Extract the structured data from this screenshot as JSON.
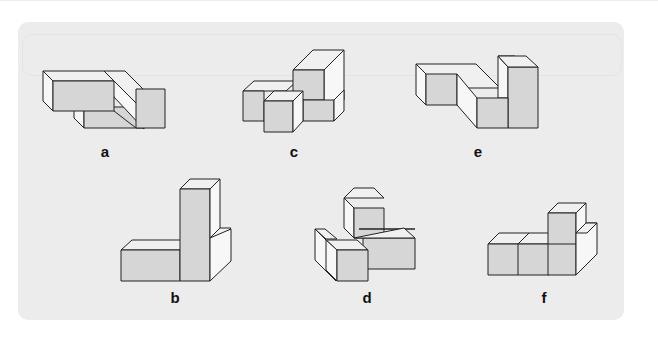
{
  "figure": {
    "title": "",
    "panel_color": "#ececec",
    "face_colors": {
      "front": "#d6d6d6",
      "side": "#f7f7f7",
      "top": "#f0f0f0",
      "edge": "#222222"
    },
    "shapes": [
      {
        "id": "a",
        "label": "a",
        "row": 1,
        "col": 1
      },
      {
        "id": "c",
        "label": "c",
        "row": 1,
        "col": 2
      },
      {
        "id": "e",
        "label": "e",
        "row": 1,
        "col": 3
      },
      {
        "id": "b",
        "label": "b",
        "row": 2,
        "col": 1
      },
      {
        "id": "d",
        "label": "d",
        "row": 2,
        "col": 2
      },
      {
        "id": "f",
        "label": "f",
        "row": 2,
        "col": 3
      }
    ]
  }
}
